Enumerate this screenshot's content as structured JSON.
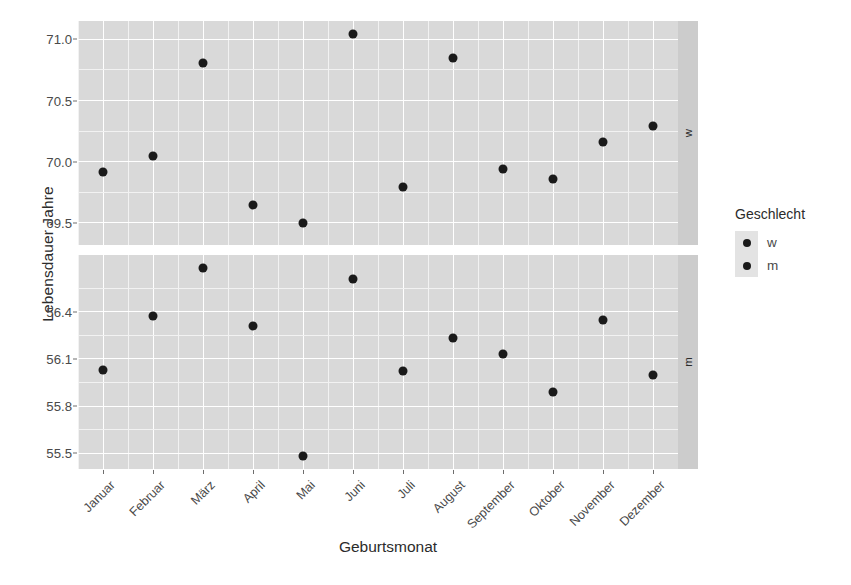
{
  "chart_data": {
    "type": "scatter",
    "title": "",
    "xlabel": "Geburtsmonat",
    "ylabel": "Lebensdauer Jahre",
    "grid": true,
    "legend": {
      "title": "Geschlecht",
      "position": "right",
      "entries": [
        {
          "label": "w",
          "marker": "circle",
          "color": "#1a1a1a"
        },
        {
          "label": "m",
          "marker": "circle",
          "color": "#1a1a1a"
        }
      ]
    },
    "facets": [
      {
        "strip_label": "w",
        "position": "top",
        "ylim": [
          69.32,
          71.15
        ],
        "yticks": [
          69.5,
          70.0,
          70.5,
          71.0
        ],
        "ytick_labels": [
          "69.5",
          "70.0",
          "70.5",
          "71.0"
        ]
      },
      {
        "strip_label": "m",
        "position": "bottom",
        "ylim": [
          55.4,
          56.76
        ],
        "yticks": [
          55.5,
          55.8,
          56.1,
          56.4
        ],
        "ytick_labels": [
          "55.5",
          "55.8",
          "56.1",
          "56.4"
        ]
      }
    ],
    "categories": [
      "Januar",
      "Februar",
      "März",
      "April",
      "Mai",
      "Juni",
      "Juli",
      "August",
      "September",
      "Oktober",
      "November",
      "Dezember"
    ],
    "series": [
      {
        "name": "w",
        "facet": "w",
        "color": "#1a1a1a",
        "values": [
          69.92,
          70.05,
          70.81,
          69.65,
          69.5,
          71.04,
          69.79,
          70.85,
          69.94,
          69.86,
          70.16,
          70.29
        ]
      },
      {
        "name": "m",
        "facet": "m",
        "color": "#1a1a1a",
        "values": [
          56.03,
          56.37,
          56.68,
          56.31,
          55.48,
          56.61,
          56.02,
          56.23,
          56.13,
          55.89,
          56.35,
          56.0
        ]
      }
    ]
  },
  "colors": {
    "panel_background": "#d9d9d9",
    "strip_background": "#cccccc",
    "major_grid": "#ffffff",
    "minor_grid": "#f2f2f2",
    "point": "#1a1a1a",
    "page_background": "#ffffff",
    "text": "#4a4a4a"
  }
}
